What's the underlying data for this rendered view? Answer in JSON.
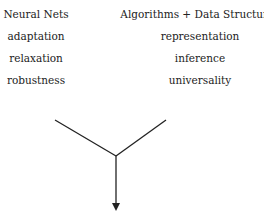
{
  "left_column": {
    "heading": "Neural Nets",
    "items": [
      "adaptation",
      "relaxation",
      "robustness"
    ]
  },
  "right_column": {
    "heading": "Algorithms + Data Structures",
    "items": [
      "representation",
      "inference",
      "universality"
    ]
  },
  "colors": {
    "line": "#222222",
    "text": "#222222"
  }
}
